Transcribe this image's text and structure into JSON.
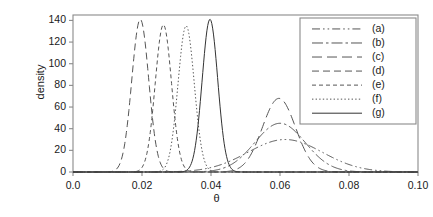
{
  "chart_data": {
    "type": "line",
    "title": "",
    "xlabel": "θ",
    "ylabel": "density",
    "xlim": [
      0.0,
      0.1
    ],
    "ylim": [
      0,
      145
    ],
    "grid": false,
    "legend_position": "right",
    "xticks": [
      {
        "value": 0.0,
        "label": "0.0"
      },
      {
        "value": 0.02,
        "label": "0.02"
      },
      {
        "value": 0.04,
        "label": "0.04"
      },
      {
        "value": 0.06,
        "label": "0.06"
      },
      {
        "value": 0.08,
        "label": "0.08"
      },
      {
        "value": 0.1,
        "label": "0.10"
      }
    ],
    "yticks": [
      {
        "value": 0,
        "label": "0"
      },
      {
        "value": 20,
        "label": "20"
      },
      {
        "value": 40,
        "label": "40"
      },
      {
        "value": 60,
        "label": "60"
      },
      {
        "value": 80,
        "label": "80"
      },
      {
        "value": 100,
        "label": "100"
      },
      {
        "value": 120,
        "label": "120"
      },
      {
        "value": 140,
        "label": "140"
      }
    ],
    "series": [
      {
        "name": "(a)",
        "dash": "dashdotdot",
        "color": "#555555",
        "peak_x": 0.0615,
        "peak_y": 30,
        "sigma": 0.0108
      },
      {
        "name": "(b)",
        "dash": "longdashdot",
        "color": "#555555",
        "peak_x": 0.06,
        "peak_y": 45,
        "sigma": 0.0073
      },
      {
        "name": "(c)",
        "dash": "longdash",
        "color": "#555555",
        "peak_x": 0.0597,
        "peak_y": 68,
        "sigma": 0.0048
      },
      {
        "name": "(d)",
        "dash": "dash",
        "color": "#555555",
        "peak_x": 0.0195,
        "peak_y": 141,
        "sigma": 0.00245
      },
      {
        "name": "(e)",
        "dash": "shortdash",
        "color": "#555555",
        "peak_x": 0.0262,
        "peak_y": 136,
        "sigma": 0.00235
      },
      {
        "name": "(f)",
        "dash": "dotted",
        "color": "#555555",
        "peak_x": 0.0328,
        "peak_y": 135,
        "sigma": 0.00235
      },
      {
        "name": "(g)",
        "dash": "solid",
        "color": "#333333",
        "peak_x": 0.0397,
        "peak_y": 141,
        "sigma": 0.00225
      }
    ],
    "legend_entries": [
      "(a)",
      "(b)",
      "(c)",
      "(d)",
      "(e)",
      "(f)",
      "(g)"
    ]
  },
  "colors": {
    "frame": "#8a8a8a",
    "axis_text": "#1a1a1a",
    "curve": "#555555",
    "legend_border": "#8a8a8a",
    "background": "#ffffff"
  }
}
